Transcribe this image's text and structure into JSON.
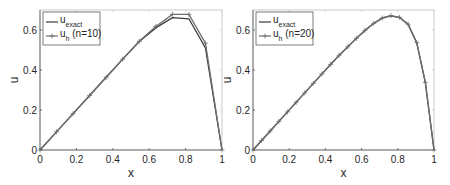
{
  "chart_data": [
    {
      "type": "line",
      "title": "",
      "xlabel": "x",
      "ylabel": "u",
      "xlim": [
        0,
        1
      ],
      "ylim": [
        0,
        0.7
      ],
      "xticks": [
        "0",
        "0.2",
        "0.4",
        "0.6",
        "0.8",
        "1"
      ],
      "yticks": [
        "0",
        "0.2",
        "0.4",
        "0.6"
      ],
      "grid": false,
      "legend_position": "upper left",
      "legend": [
        {
          "base": "u",
          "sub": "exact",
          "suffix": ""
        },
        {
          "base": "u",
          "sub": "h",
          "suffix": " (n=10)"
        }
      ],
      "series": [
        {
          "name": "u_exact",
          "marker": "none",
          "x": [
            0,
            0.0909,
            0.1818,
            0.2727,
            0.3636,
            0.4545,
            0.5455,
            0.6364,
            0.7273,
            0.8182,
            0.9091,
            1
          ],
          "y": [
            0,
            0.0909,
            0.1818,
            0.2727,
            0.3636,
            0.4543,
            0.5423,
            0.6105,
            0.662,
            0.656,
            0.51,
            0
          ]
        },
        {
          "name": "u_h (n=10)",
          "marker": "+",
          "x": [
            0,
            0.0909,
            0.1818,
            0.2727,
            0.3636,
            0.4545,
            0.5455,
            0.6364,
            0.7273,
            0.8182,
            0.9091,
            1
          ],
          "y": [
            0,
            0.0909,
            0.1818,
            0.2727,
            0.3636,
            0.4545,
            0.5434,
            0.618,
            0.678,
            0.678,
            0.534,
            0
          ]
        }
      ]
    },
    {
      "type": "line",
      "title": "",
      "xlabel": "x",
      "ylabel": "u",
      "xlim": [
        0,
        1
      ],
      "ylim": [
        0,
        0.7
      ],
      "xticks": [
        "0",
        "0.2",
        "0.4",
        "0.6",
        "0.8",
        "1"
      ],
      "yticks": [
        "0",
        "0.2",
        "0.4",
        "0.6"
      ],
      "grid": false,
      "legend_position": "upper left",
      "legend": [
        {
          "base": "u",
          "sub": "exact",
          "suffix": ""
        },
        {
          "base": "u",
          "sub": "h",
          "suffix": " (n=20)"
        }
      ],
      "series": [
        {
          "name": "u_exact",
          "marker": "none",
          "x": [
            0,
            0.0476,
            0.0952,
            0.1429,
            0.1905,
            0.2381,
            0.2857,
            0.3333,
            0.381,
            0.4286,
            0.4762,
            0.5238,
            0.5714,
            0.619,
            0.6667,
            0.7143,
            0.7619,
            0.8095,
            0.8571,
            0.9048,
            0.9524,
            1
          ],
          "y": [
            0,
            0.0476,
            0.0952,
            0.1429,
            0.1905,
            0.2381,
            0.2857,
            0.3333,
            0.3808,
            0.4278,
            0.4735,
            0.5157,
            0.5581,
            0.5978,
            0.6326,
            0.6593,
            0.6706,
            0.6625,
            0.6278,
            0.5355,
            0.3356,
            0
          ]
        },
        {
          "name": "u_h (n=20)",
          "marker": "+",
          "x": [
            0,
            0.0476,
            0.0952,
            0.1429,
            0.1905,
            0.2381,
            0.2857,
            0.3333,
            0.381,
            0.4286,
            0.4762,
            0.5238,
            0.5714,
            0.619,
            0.6667,
            0.7143,
            0.7619,
            0.8095,
            0.8571,
            0.9048,
            0.9524,
            1
          ],
          "y": [
            0,
            0.0476,
            0.0952,
            0.1429,
            0.1905,
            0.2381,
            0.2857,
            0.3333,
            0.3808,
            0.4279,
            0.4737,
            0.5162,
            0.5587,
            0.5986,
            0.6335,
            0.6603,
            0.6716,
            0.6637,
            0.629,
            0.537,
            0.338,
            0
          ]
        }
      ]
    }
  ],
  "colors": {
    "exact": "#3a3a3a",
    "approx": "#6e6e6e",
    "axis": "#262626",
    "legend_border": "#262626"
  }
}
